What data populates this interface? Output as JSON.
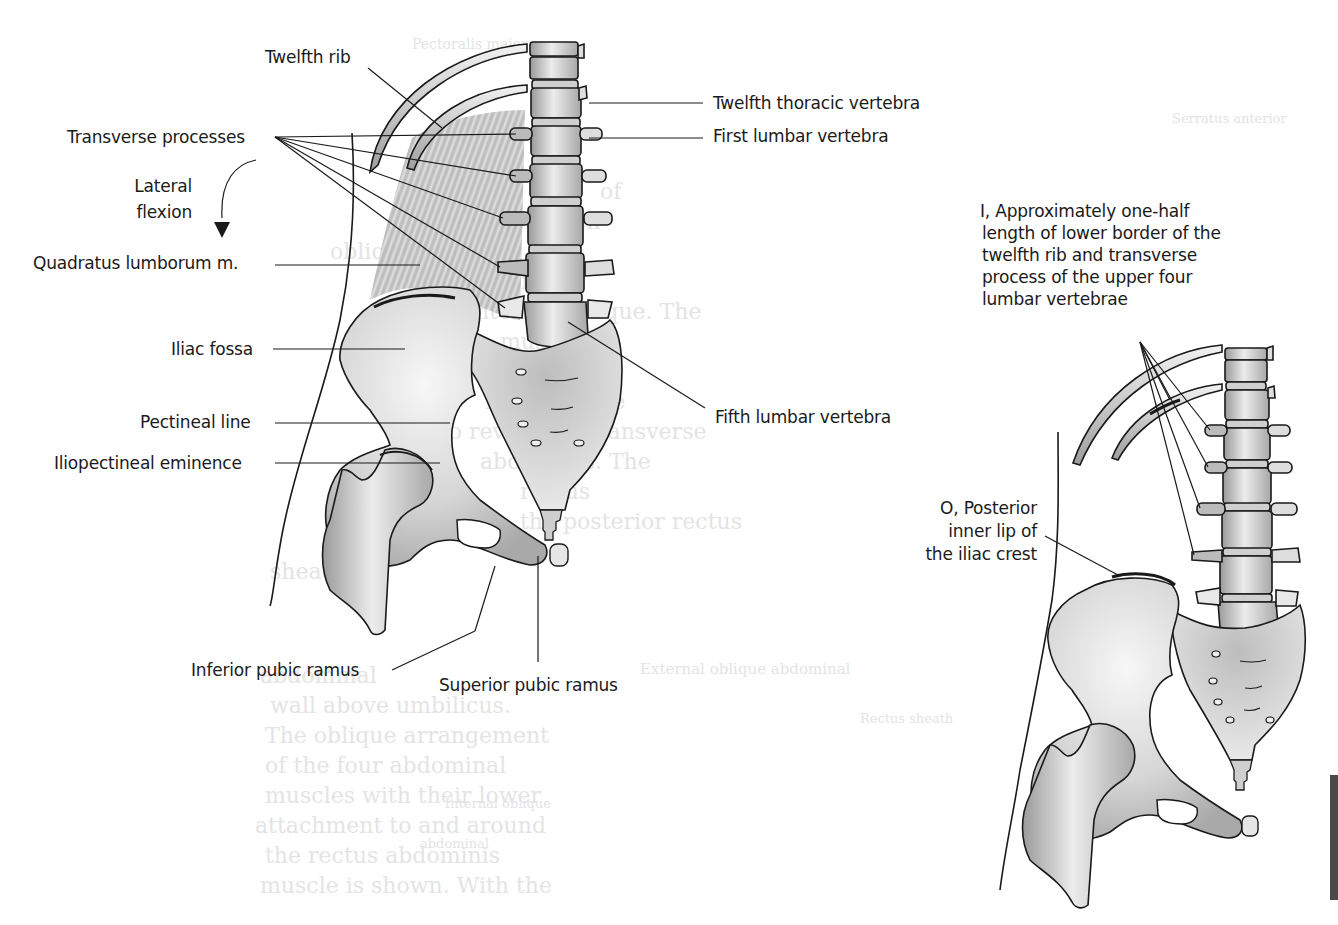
{
  "figure": {
    "colors": {
      "background": "#ffffff",
      "line": "#1a1a1a",
      "bone_fill": "#d9d9d9",
      "bone_shadow": "#9a9a9a",
      "muscle": "#bdbdbd",
      "bleed_text": "#e4e4e4",
      "edge_tab": "#4a4a4a"
    }
  },
  "left_view": {
    "labels": {
      "twelfth_rib": "Twelfth rib",
      "transverse_processes": "Transverse processes",
      "lateral_flexion_line1": "Lateral",
      "lateral_flexion_line2": "flexion",
      "quadratus_lumborum": "Quadratus lumborum m.",
      "iliac_fossa": "Iliac fossa",
      "pectineal_line": "Pectineal line",
      "iliopectineal_eminence": "Iliopectineal eminence",
      "inferior_pubic_ramus": "Inferior pubic ramus",
      "superior_pubic_ramus": "Superior pubic ramus",
      "twelfth_thoracic_vertebra": "Twelfth thoracic vertebra",
      "first_lumbar_vertebra": "First lumbar vertebra",
      "fifth_lumbar_vertebra": "Fifth lumbar vertebra"
    },
    "arrow": "lateral-flexion-arrow"
  },
  "right_view": {
    "insertion_label": {
      "line1": "I, Approximately one-half",
      "line2": "length of lower border of the",
      "line3": "twelfth rib and transverse",
      "line4": "process of the upper four",
      "line5": "lumbar vertebrae"
    },
    "origin_label": {
      "line1": "O, Posterior",
      "line2": "inner lip of",
      "line3": "the iliac crest"
    }
  },
  "bleed_through_text": {
    "top": "Pectoralis major",
    "left_para": [
      "of",
      "the abdomen",
      "oblique has been",
      "the right side to",
      "the internal oblique. The",
      "muscle",
      "has been",
      "removed the",
      "to reveal the transverse",
      "abdominis. The",
      "rectus",
      "has been",
      "the posterior rectus",
      "sheath"
    ],
    "left_lower": [
      "abdominal",
      "wall above umbilicus.",
      "The oblique arrangement",
      "of the four abdominal",
      "muscles with their lower",
      "attachment to and around",
      "the rectus abdominis",
      "muscle is shown. With the",
      "Internal oblique",
      "abdominal"
    ],
    "captions": [
      "External oblique abdominal",
      "Transversus abdominis",
      "Rectus sheath",
      "Internal oblique abdominal",
      "Transversus",
      "Serratus anterior"
    ]
  }
}
